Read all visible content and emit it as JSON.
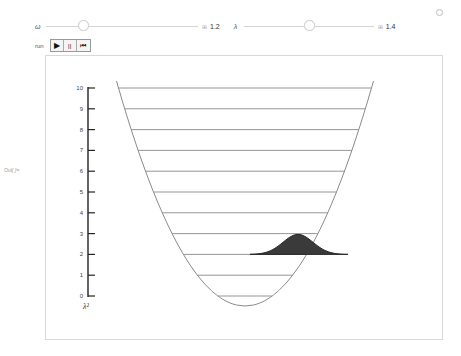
{
  "controls": {
    "omega": {
      "symbol": "ω",
      "value": "1.2",
      "min": 0,
      "max": 5,
      "thumb_fraction": 0.24
    },
    "lambda": {
      "symbol": "λ",
      "value": "1.4",
      "min": 0,
      "max": 3,
      "thumb_fraction": 0.47
    },
    "run_label": "run",
    "buttons": [
      {
        "name": "play-button",
        "icon": "play-icon",
        "glyph": "▶"
      },
      {
        "name": "pause-button",
        "icon": "pause-icon",
        "glyph": "||"
      },
      {
        "name": "reset-button",
        "icon": "reset-icon",
        "glyph": "⏮"
      }
    ]
  },
  "output_label": "Out[ ]=",
  "plot": {
    "y_axis_label": "λ²",
    "y_ticks": [
      "0",
      "1",
      "2",
      "3",
      "4",
      "5",
      "6",
      "7",
      "8",
      "9",
      "10"
    ],
    "energy_levels": [
      0,
      1,
      2,
      3,
      4,
      5,
      6,
      7,
      8,
      9,
      10
    ],
    "packet_level": 2,
    "colors": {
      "curve": "#8a8a8a",
      "levels": "#8a8a8a",
      "packet": "#3a3a3a",
      "axis": "#222222"
    }
  }
}
